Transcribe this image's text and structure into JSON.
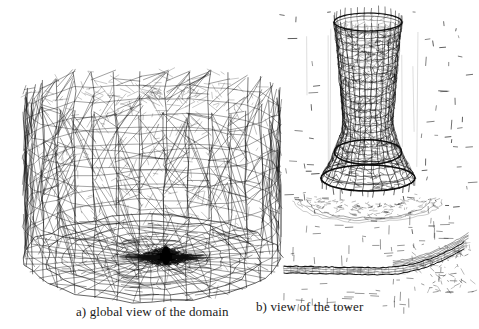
{
  "figure": {
    "kind": "scientific-figure-scan",
    "background_color": "#ffffff",
    "ink_color": "#0d0d0d",
    "width": 479,
    "height": 329
  },
  "captions": {
    "a": "a) global view of the domain",
    "b": "b) view of the tower"
  },
  "panels": [
    {
      "id": "a",
      "name": "global-view-of-the-domain",
      "caption": "a) global view of the domain",
      "content": "3D unstructured tetrahedral mesh of a prismatic (hexagonal-plan) far-field domain, drawn as a black wireframe in perspective, with a strongly refined dense dark cluster of elements near the centre of the ground plane where the tower stands",
      "bounds": {
        "x": 18,
        "y": 78,
        "w": 268,
        "h": 212
      },
      "mesh": {
        "style": "wireframe",
        "plan_sides": 6,
        "plan_radius_x": 128,
        "plan_radius_y": 44,
        "centre_x": 152,
        "ground_y": 258,
        "top_y": 92,
        "vertical_columns": 34,
        "horizontal_levels": 9,
        "ground_rings": 9,
        "ground_spokes": 40,
        "refined_core": {
          "x": 166,
          "y": 257,
          "rx": 22,
          "ry": 5,
          "color": "#000000",
          "description": "dense black refined zone at tower footprint"
        }
      }
    },
    {
      "id": "b",
      "name": "view-of-the-tower",
      "caption": "b) view of the tower",
      "content": "Close-up of the natural-draught cooling tower: a hyperboloid shell surface meshed with a fine quadrilateral/triangular grid, its flared base ring, the surrounding sparse far-field edges seen nearly edge-on as short dashes, and a curved ground/terrain strip below",
      "bounds": {
        "x": 280,
        "y": 14,
        "w": 196,
        "h": 280
      },
      "tower": {
        "top_y": 22,
        "throat_y": 120,
        "base_y": 178,
        "centre_x": 368,
        "top_rx": 34,
        "throat_rx": 25,
        "base_rx": 47,
        "rim_ry": 9,
        "base_ry": 13,
        "meridians": 30,
        "parallels": 22
      },
      "ground_strip": {
        "x_start": 284,
        "x_end": 466,
        "y_left": 266,
        "y_right": 240,
        "description": "curved meshed terrain / beam section rising to the right"
      },
      "scatter": {
        "count": 150,
        "description": "short far-field dashes around the tower"
      }
    }
  ]
}
